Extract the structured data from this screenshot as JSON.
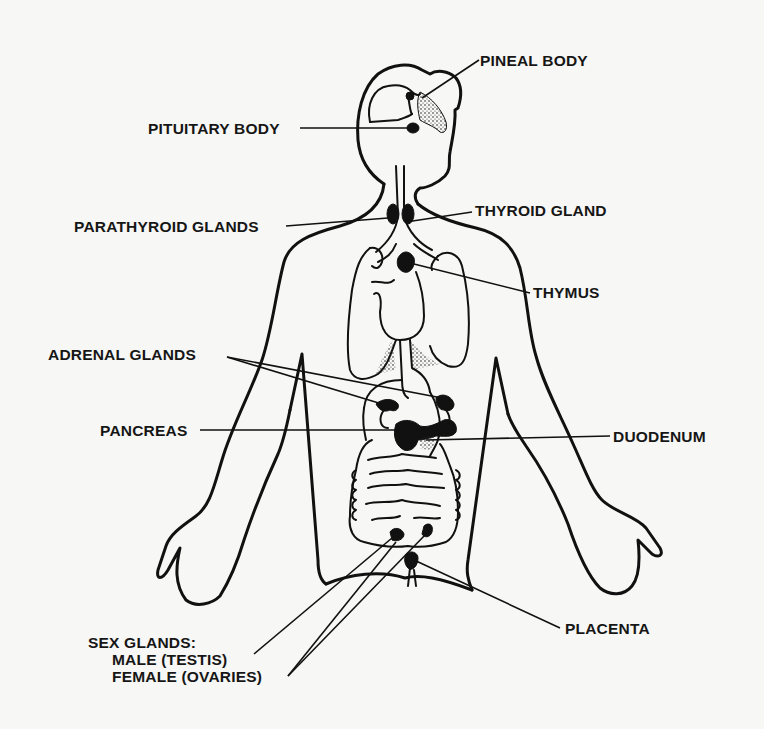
{
  "diagram": {
    "background_color": "#f7f7f5",
    "line_color": "#111111",
    "labels": {
      "pineal_body": "PINEAL  BODY",
      "pituitary_body": "PITUITARY  BODY",
      "thyroid_gland": "THYROID  GLAND",
      "parathyroid_glands": "PARATHYROID  GLANDS",
      "thymus": "THYMUS",
      "adrenal_glands": "ADRENAL  GLANDS",
      "pancreas": "PANCREAS",
      "duodenum": "DUODENUM",
      "placenta": "PLACENTA",
      "sex_glands": {
        "title": "SEX  GLANDS:",
        "male": "MALE (TESTIS)",
        "female": "FEMALE  (OVARIES)"
      }
    }
  }
}
